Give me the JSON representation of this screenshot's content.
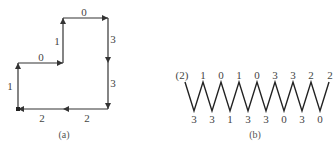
{
  "figure_a": {
    "caption": "(a)",
    "edges": [
      {
        "from": [
          18,
          109
        ],
        "to": [
          18,
          63
        ],
        "label": "1",
        "label_pos": [
          10,
          86
        ]
      },
      {
        "from": [
          18,
          63
        ],
        "to": [
          63,
          63
        ],
        "label": "0",
        "label_pos": [
          41,
          57
        ]
      },
      {
        "from": [
          63,
          63
        ],
        "to": [
          63,
          18
        ],
        "label": "1",
        "label_pos": [
          57,
          41
        ]
      },
      {
        "from": [
          63,
          18
        ],
        "to": [
          108,
          18
        ],
        "label": "0",
        "label_pos": [
          84,
          12
        ]
      },
      {
        "from": [
          108,
          18
        ],
        "to": [
          108,
          63
        ],
        "label": "3",
        "label_pos": [
          113,
          39
        ]
      },
      {
        "from": [
          108,
          63
        ],
        "to": [
          108,
          109
        ],
        "label": "3",
        "label_pos": [
          113,
          83
        ]
      },
      {
        "from": [
          108,
          109
        ],
        "to": [
          63,
          109
        ],
        "label": "2",
        "label_pos": [
          87,
          118
        ]
      },
      {
        "from": [
          63,
          109
        ],
        "to": [
          18,
          109
        ],
        "label": "2",
        "label_pos": [
          42,
          118
        ]
      }
    ]
  },
  "figure_b": {
    "caption": "(b)",
    "top_labels": [
      "(2)",
      "1",
      "0",
      "1",
      "0",
      "3",
      "3",
      "2",
      "2"
    ],
    "bottom_labels": [
      "3",
      "3",
      "1",
      "3",
      "3",
      "0",
      "3",
      "0"
    ],
    "zigzag": {
      "x_start": 185,
      "step": 18,
      "peaks": 8,
      "y_top": 82,
      "y_bottom": 111
    }
  }
}
